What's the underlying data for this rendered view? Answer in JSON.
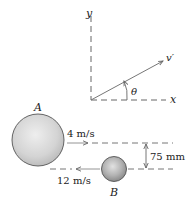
{
  "diagram": {
    "axes": {
      "x_label": "x",
      "y_label": "y"
    },
    "vector": {
      "label": "v′",
      "angle_label": "θ"
    },
    "sphere_a": {
      "label": "A",
      "velocity_label": "4 m/s",
      "direction": "right"
    },
    "sphere_b": {
      "label": "B",
      "velocity_label": "12 m/s",
      "direction": "left"
    },
    "offset": {
      "label": "75 mm"
    },
    "colors": {
      "line": "#555555",
      "dashed": "#666666",
      "sphere_fill": "#cfcfcf",
      "sphere_edge": "#555555"
    }
  }
}
